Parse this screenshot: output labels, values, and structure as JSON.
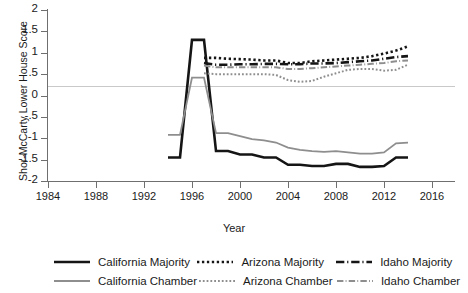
{
  "chart_data": {
    "type": "line",
    "title": "",
    "xlabel": "Year",
    "ylabel": "Shor-McCarty Lower House Score",
    "xlim": [
      1984,
      2016
    ],
    "ylim": [
      -2,
      2
    ],
    "grid": false,
    "zero_line": true,
    "legend_position": "bottom",
    "xticks": [
      "1984",
      "1988",
      "1992",
      "1996",
      "2000",
      "2004",
      "2008",
      "2012",
      "2016"
    ],
    "yticks": [
      "2",
      "1.5",
      "1",
      ".5",
      "0",
      "-.5",
      "-1",
      "-1.5",
      "-2"
    ],
    "x": [
      1994,
      1995,
      1996,
      1997,
      1998,
      1999,
      2000,
      2001,
      2002,
      2003,
      2004,
      2005,
      2006,
      2007,
      2008,
      2009,
      2010,
      2011,
      2012,
      2013,
      2014
    ],
    "series": [
      {
        "name": "California Majority",
        "color": "#151515",
        "style": "solid",
        "width": 2.6,
        "values": [
          -1.45,
          -1.45,
          1.3,
          1.3,
          -1.3,
          -1.3,
          -1.38,
          -1.38,
          -1.45,
          -1.45,
          -1.62,
          -1.62,
          -1.65,
          -1.65,
          -1.6,
          -1.6,
          -1.67,
          -1.67,
          -1.65,
          -1.45,
          -1.45
        ]
      },
      {
        "name": "California Chamber",
        "color": "#8e8e8e",
        "style": "solid",
        "width": 1.8,
        "values": [
          -0.92,
          -0.92,
          0.42,
          0.42,
          -0.88,
          -0.88,
          -0.95,
          -1.02,
          -1.05,
          -1.1,
          -1.22,
          -1.27,
          -1.3,
          -1.32,
          -1.3,
          -1.33,
          -1.36,
          -1.36,
          -1.33,
          -1.12,
          -1.1
        ]
      },
      {
        "name": "Arizona Majority",
        "color": "#151515",
        "style": "dotted",
        "width": 2.6,
        "values": [
          null,
          null,
          null,
          0.88,
          0.88,
          0.86,
          0.85,
          0.84,
          0.82,
          0.82,
          0.76,
          0.76,
          0.8,
          0.82,
          0.84,
          0.86,
          0.88,
          0.92,
          0.98,
          1.05,
          1.15
        ]
      },
      {
        "name": "Arizona Chamber",
        "color": "#8e8e8e",
        "style": "dotted",
        "width": 2.0,
        "values": [
          null,
          null,
          null,
          0.52,
          0.5,
          0.5,
          0.5,
          0.5,
          0.5,
          0.48,
          0.36,
          0.32,
          0.34,
          0.44,
          0.52,
          0.6,
          0.62,
          0.62,
          0.58,
          0.6,
          0.72
        ]
      },
      {
        "name": "Idaho Majority",
        "color": "#151515",
        "style": "dashdot",
        "width": 2.6,
        "values": [
          null,
          null,
          null,
          0.76,
          0.72,
          0.72,
          0.73,
          0.73,
          0.74,
          0.74,
          0.73,
          0.73,
          0.75,
          0.75,
          0.76,
          0.78,
          0.8,
          0.82,
          0.86,
          0.9,
          0.92
        ]
      },
      {
        "name": "Idaho Chamber",
        "color": "#8e8e8e",
        "style": "dashdot",
        "width": 2.0,
        "values": [
          null,
          null,
          null,
          0.7,
          0.66,
          0.66,
          0.66,
          0.66,
          0.66,
          0.66,
          0.62,
          0.62,
          0.64,
          0.66,
          0.68,
          0.7,
          0.72,
          0.74,
          0.76,
          0.8,
          0.82
        ]
      }
    ]
  },
  "axes": {
    "y_title": "Shor-McCarty Lower House Score",
    "x_title": "Year"
  },
  "legend": {
    "rows": [
      [
        {
          "label": "California Majority",
          "color": "#151515",
          "style": "solid",
          "width": 2.6
        },
        {
          "label": "Arizona Majority",
          "color": "#151515",
          "style": "dotted",
          "width": 2.6
        },
        {
          "label": "Idaho Majority",
          "color": "#151515",
          "style": "dashdot",
          "width": 2.6
        }
      ],
      [
        {
          "label": "California Chamber",
          "color": "#8e8e8e",
          "style": "solid",
          "width": 1.8
        },
        {
          "label": "Arizona Chamber",
          "color": "#8e8e8e",
          "style": "dotted",
          "width": 2.0
        },
        {
          "label": "Idaho Chamber",
          "color": "#8e8e8e",
          "style": "dashdot",
          "width": 2.0
        }
      ]
    ]
  }
}
